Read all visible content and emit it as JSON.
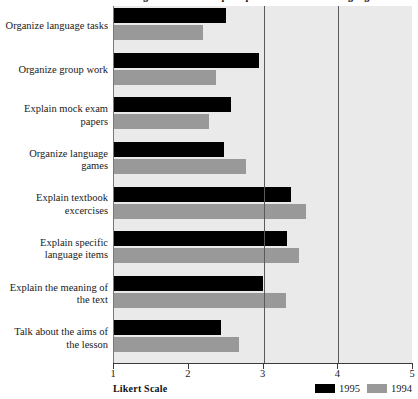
{
  "chart_data": {
    "type": "bar",
    "orientation": "horizontal",
    "title": "Figure 1. Teachers' perceptions of classroom language use",
    "xlabel": "Likert Scale",
    "ylabel": "",
    "xlim": [
      1,
      5
    ],
    "xticks": [
      1,
      2,
      3,
      4,
      5
    ],
    "xticklabels": [
      "1",
      "2",
      "3",
      "4",
      "5"
    ],
    "grid": true,
    "gridlines_at": [
      3,
      4
    ],
    "legend_position": "bottom-right",
    "categories": [
      "Organize language tasks",
      "Organize group work",
      "Explain mock exam papers",
      "Organize language games",
      "Explain textbook excercises",
      "Explain specific language items",
      "Explain the meaning of the text",
      "Talk about the aims of the lesson"
    ],
    "series": [
      {
        "name": "1995",
        "color": "#000000",
        "values": [
          2.5,
          2.94,
          2.57,
          2.47,
          3.37,
          3.32,
          2.99,
          2.43
        ]
      },
      {
        "name": "1994",
        "color": "#999999",
        "values": [
          2.19,
          2.37,
          2.27,
          2.77,
          3.57,
          3.48,
          3.3,
          2.67
        ]
      }
    ],
    "colors": {
      "plot_background": "#eaeaea",
      "gridline": "#5a5a5a",
      "axis": "#3a3a3a",
      "page_background": "#ffffff"
    }
  }
}
